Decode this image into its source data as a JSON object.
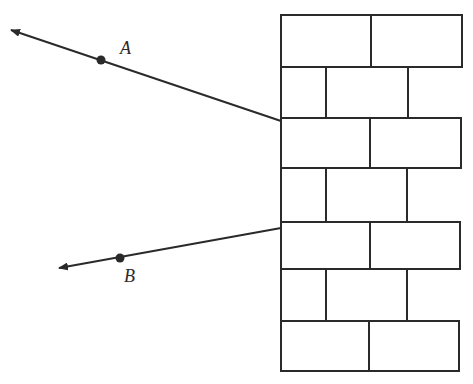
{
  "labels": {
    "point_a": "A",
    "point_b": "B"
  },
  "colors": {
    "stroke": "#2a2a2a",
    "background": "#ffffff"
  },
  "wall": {
    "left": 281,
    "rows": [
      {
        "top": 15,
        "bottom": 67,
        "joints": [
          371
        ],
        "right": 462
      },
      {
        "top": 67,
        "bottom": 118,
        "joints": [
          326,
          408
        ],
        "right": 408
      },
      {
        "top": 118,
        "bottom": 168,
        "joints": [
          370
        ],
        "right": 461
      },
      {
        "top": 168,
        "bottom": 222,
        "joints": [
          326,
          407
        ],
        "right": 407
      },
      {
        "top": 222,
        "bottom": 269,
        "joints": [
          370
        ],
        "right": 460
      },
      {
        "top": 269,
        "bottom": 321,
        "joints": [
          326,
          407
        ],
        "right": 407
      },
      {
        "top": 321,
        "bottom": 371,
        "joints": [
          369
        ],
        "right": 459
      }
    ]
  },
  "rays": [
    {
      "name": "ray-a",
      "from": [
        281,
        121
      ],
      "to": [
        11,
        30
      ],
      "point": [
        101,
        60
      ]
    },
    {
      "name": "ray-b",
      "from": [
        281,
        228
      ],
      "to": [
        59,
        268
      ],
      "point": [
        120,
        258
      ]
    }
  ]
}
